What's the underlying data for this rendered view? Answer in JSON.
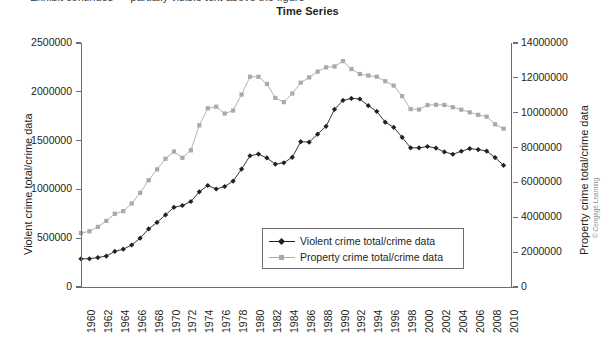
{
  "page": {
    "cutoff_text": "Exhibit continues — partially visible text above the figure"
  },
  "chart": {
    "title": "Time Series",
    "copyright": "© Cengage Learning",
    "left_axis_title": "Violent crime total/crime data",
    "right_axis_title": "Property crime total/crime data",
    "legend": [
      {
        "label": "Violent crime total/crime data",
        "color": "#231f20",
        "marker": "diamond"
      },
      {
        "label": "Property crime total/crime data",
        "color": "#a7a9ac",
        "marker": "square"
      }
    ]
  },
  "chart_data": {
    "type": "line",
    "title": "Time Series",
    "xlabel": "",
    "ylabel": "Violent crime total/crime data",
    "y2label": "Property crime total/crime data",
    "grid": false,
    "legend_position": "inside-bottom-center",
    "xlim": [
      1960,
      2011
    ],
    "ylim": [
      0,
      2500000
    ],
    "y2lim": [
      0,
      14000000
    ],
    "yticks": [
      0,
      500000,
      1000000,
      1500000,
      2000000,
      2500000
    ],
    "y2ticks": [
      0,
      2000000,
      4000000,
      6000000,
      8000000,
      10000000,
      12000000,
      14000000
    ],
    "xticks": [
      1960,
      1962,
      1964,
      1966,
      1968,
      1970,
      1972,
      1974,
      1976,
      1978,
      1980,
      1982,
      1984,
      1986,
      1988,
      1990,
      1992,
      1994,
      1996,
      1998,
      2000,
      2002,
      2004,
      2006,
      2008,
      2010
    ],
    "x": [
      1960,
      1961,
      1962,
      1963,
      1964,
      1965,
      1966,
      1967,
      1968,
      1969,
      1970,
      1971,
      1972,
      1973,
      1974,
      1975,
      1976,
      1977,
      1978,
      1979,
      1980,
      1981,
      1982,
      1983,
      1984,
      1985,
      1986,
      1987,
      1988,
      1989,
      1990,
      1991,
      1992,
      1993,
      1994,
      1995,
      1996,
      1997,
      1998,
      1999,
      2000,
      2001,
      2002,
      2003,
      2004,
      2005,
      2006,
      2007,
      2008,
      2009,
      2010
    ],
    "series": [
      {
        "name": "Violent crime total/crime data",
        "axis": "left",
        "color": "#231f20",
        "marker": "diamond",
        "values": [
          288460,
          289390,
          301510,
          316970,
          364220,
          387390,
          430180,
          499930,
          595010,
          661870,
          738820,
          816500,
          834900,
          875910,
          974720,
          1039710,
          1004210,
          1029580,
          1085550,
          1208030,
          1344520,
          1361820,
          1322390,
          1258090,
          1273280,
          1328800,
          1489170,
          1484000,
          1566220,
          1646040,
          1820130,
          1911770,
          1932270,
          1926020,
          1857670,
          1798790,
          1688540,
          1636100,
          1533890,
          1426040,
          1425490,
          1439480,
          1423680,
          1383680,
          1360090,
          1390750,
          1418040,
          1408340,
          1392630,
          1325900,
          1246250
        ]
      },
      {
        "name": "Property crime total/crime data",
        "axis": "right",
        "color": "#a7a9ac",
        "marker": "square",
        "values": [
          3095700,
          3198600,
          3450700,
          3792500,
          4200400,
          4352000,
          4793300,
          5403500,
          6125200,
          6749000,
          7359200,
          7771700,
          7413900,
          7842200,
          9278700,
          10252700,
          10345500,
          9955000,
          10123400,
          11041500,
          12063700,
          12061900,
          11652000,
          10850500,
          10608500,
          11102600,
          11722700,
          12024700,
          12356900,
          12605400,
          12655500,
          12961100,
          12505900,
          12218800,
          12131900,
          12063900,
          11805300,
          11558475,
          10951827,
          10208334,
          10182584,
          10437189,
          10455277,
          10442862,
          10319386,
          10174754,
          10019601,
          9882212,
          9774152,
          9337060,
          9082887
        ]
      }
    ]
  }
}
